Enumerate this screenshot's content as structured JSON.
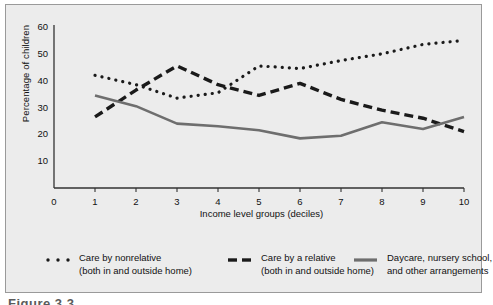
{
  "figure": {
    "caption": "Figure 3.3",
    "background_color": "#ececec",
    "border_color": "#9a9a9a"
  },
  "chart_data": {
    "type": "line",
    "title": "",
    "xlabel": "Income level groups (deciles)",
    "ylabel": "Percentage of children",
    "x": [
      1,
      2,
      3,
      4,
      5,
      6,
      7,
      8,
      9,
      10
    ],
    "xtick_labels": [
      "0",
      "1",
      "2",
      "3",
      "4",
      "5",
      "6",
      "7",
      "8",
      "9",
      "10"
    ],
    "ytick_labels": [
      "10",
      "20",
      "30",
      "40",
      "50",
      "60"
    ],
    "xlim": [
      0,
      10
    ],
    "ylim": [
      0,
      60
    ],
    "grid": false,
    "legend_position": "below",
    "series": [
      {
        "name": "Care by nonrelative (both in and outside home)",
        "name_line1": "Care by nonrelative",
        "name_line2": "(both in and outside home)",
        "style": "dotted",
        "color": "#1a1a1a",
        "values": [
          42,
          38.5,
          33.5,
          35.5,
          45.5,
          44.5,
          47.5,
          50,
          53.5,
          55
        ]
      },
      {
        "name": "Care by a relative (both in and outside home)",
        "name_line1": "Care by a relative",
        "name_line2": "(both in and outside home)",
        "style": "dashed",
        "color": "#1a1a1a",
        "values": [
          26.5,
          36.5,
          45.5,
          38.5,
          34.5,
          39,
          33,
          29,
          26,
          21
        ]
      },
      {
        "name": "Daycare, nursery school, and other arrangements",
        "name_line1": "Daycare, nursery school,",
        "name_line2": "and other arrangements",
        "style": "solid",
        "color": "#6e6e6e",
        "values": [
          34.5,
          30.5,
          24,
          23,
          21.5,
          18.5,
          19.5,
          24.5,
          22,
          26.5
        ]
      }
    ]
  }
}
